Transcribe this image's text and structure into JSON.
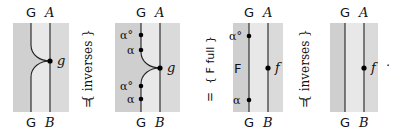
{
  "colors": {
    "dark_region": "#cfcfcf",
    "mid_region": "#e6e6e6",
    "light_region": "#d9d9d9",
    "wire": "#222222",
    "dot": "#000000"
  },
  "panels": [
    {
      "id": "panel-1",
      "top_labels": [
        "G",
        "A"
      ],
      "bottom_labels": [
        "G",
        "B"
      ],
      "morphism": "g",
      "markers": []
    },
    {
      "id": "panel-2",
      "top_labels": [
        "G",
        "A"
      ],
      "bottom_labels": [
        "G",
        "B"
      ],
      "morphism": "g",
      "markers": [
        "α°",
        "α",
        "α°",
        "α"
      ]
    },
    {
      "id": "panel-3",
      "top_labels": [
        "G",
        "A"
      ],
      "bottom_labels": [
        "G",
        "B"
      ],
      "morphism": "f",
      "region_label": "F",
      "markers": [
        "α°",
        "α"
      ]
    },
    {
      "id": "panel-4",
      "top_labels": [
        "G",
        "A"
      ],
      "bottom_labels": [
        "G",
        "B"
      ],
      "morphism": "f",
      "trailing": "·",
      "markers": []
    }
  ],
  "equalities": [
    {
      "symbol": "=",
      "justification": "{ inverses }"
    },
    {
      "symbol": "=",
      "justification": "{ F full }"
    },
    {
      "symbol": "=",
      "justification": "{ inverses }"
    }
  ]
}
